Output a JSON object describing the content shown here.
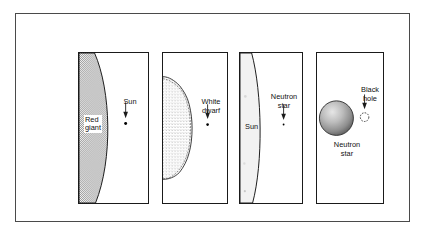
{
  "figure": {
    "background_color": "#ffffff",
    "frame_color": "#4a4a4a",
    "panel_border_color": "#1a1a1a"
  },
  "panels": [
    {
      "id": "red-giant",
      "primary_label": "Red\ngiant",
      "secondary_label": "Sun",
      "primary_fill": "#b8b8b8",
      "marker": "dot",
      "description": "Large shaded arc filling most of panel labeled Red giant; small dot labeled Sun with downward arrow"
    },
    {
      "id": "white-dwarf",
      "primary_label": "Sun",
      "secondary_label": "White\ndwarf",
      "primary_fill": "#ffffff",
      "marker": "dot",
      "description": "Stippled half-disc representing the Sun; tiny dot labeled White dwarf with downward arrow"
    },
    {
      "id": "neutron-star",
      "primary_label": "Sun",
      "secondary_label": "Neutron\nstar",
      "primary_fill": "#f0f0f0",
      "marker": "dot",
      "description": "Pale shaded arc labeled Sun; very small dot labeled Neutron star with downward arrow"
    },
    {
      "id": "black-hole",
      "primary_label": "Neutron\nstar",
      "secondary_label": "Black\nhole",
      "primary_fill": "#9a9a9a",
      "marker": "dashed-circle",
      "description": "Shaded sphere labeled Neutron star; small dashed circle labeled Black hole with downward arrow"
    }
  ],
  "labels": {
    "red_giant": "Red\ngiant",
    "sun_panel1": "Sun",
    "white_dwarf": "White\ndwarf",
    "sun_panel3": "Sun",
    "neutron_star_panel3": "Neutron\nstar",
    "neutron_star_panel4": "Neutron\nstar",
    "black_hole": "Black\nhole"
  }
}
